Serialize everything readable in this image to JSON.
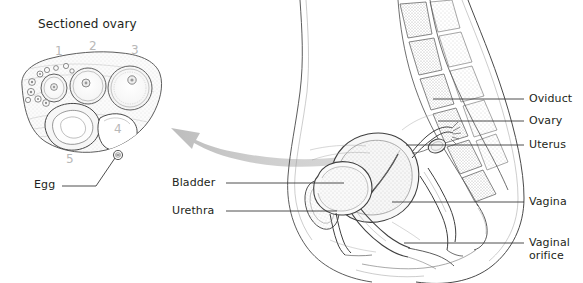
{
  "figure": {
    "title": "Sectioned ovary",
    "background_color": "#ffffff",
    "ink_color": "#231f20",
    "number_color": "#b8b8b8",
    "arrow_color": "#c9c9c9"
  },
  "ovary_inset": {
    "title": "Sectioned ovary",
    "stage_numbers": [
      "1",
      "2",
      "3",
      "4",
      "5"
    ],
    "egg_label": "Egg"
  },
  "arrow": {
    "name": "curved-arrow",
    "direction": "right-to-left",
    "color": "#c9c9c9"
  },
  "sagittal_labels": {
    "left": [
      {
        "id": "bladder",
        "text": "Bladder"
      },
      {
        "id": "urethra",
        "text": "Urethra"
      }
    ],
    "right": [
      {
        "id": "oviduct",
        "text": "Oviduct"
      },
      {
        "id": "ovary",
        "text": "Ovary"
      },
      {
        "id": "uterus",
        "text": "Uterus"
      },
      {
        "id": "vagina",
        "text": "Vagina"
      },
      {
        "id": "vaginal-orifice-1",
        "text": "Vaginal"
      },
      {
        "id": "vaginal-orifice-2",
        "text": "orifice"
      }
    ]
  }
}
